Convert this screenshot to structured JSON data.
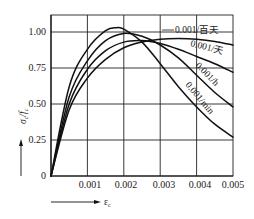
{
  "chart_data": {
    "type": "line",
    "title": "",
    "xlabel": "ε_c",
    "ylabel": "σ_c / f_c",
    "xlim": [
      0,
      0.005
    ],
    "ylim": [
      0,
      1.1
    ],
    "grid": true,
    "x_ticks": [
      "0.001",
      "0.002",
      "0.003",
      "0.004",
      "0.005"
    ],
    "y_ticks": [
      "0",
      "0.25",
      "0.50",
      "0.75",
      "1.00"
    ],
    "series": [
      {
        "name": "0.001/min",
        "x": [
          0,
          0.0005,
          0.001,
          0.0015,
          0.0018,
          0.002,
          0.0025,
          0.003,
          0.0035,
          0.004,
          0.0045,
          0.005
        ],
        "y": [
          0,
          0.62,
          0.88,
          1.01,
          1.03,
          1.02,
          0.93,
          0.78,
          0.62,
          0.48,
          0.36,
          0.27
        ]
      },
      {
        "name": "0.001/h",
        "x": [
          0,
          0.0005,
          0.001,
          0.0015,
          0.002,
          0.0025,
          0.003,
          0.0035,
          0.004,
          0.0045,
          0.005
        ],
        "y": [
          0,
          0.55,
          0.8,
          0.94,
          0.99,
          0.97,
          0.91,
          0.82,
          0.7,
          0.58,
          0.48
        ]
      },
      {
        "name": "0.001/天",
        "x": [
          0,
          0.0005,
          0.001,
          0.0015,
          0.002,
          0.0025,
          0.003,
          0.0035,
          0.004,
          0.0045,
          0.005
        ],
        "y": [
          0,
          0.5,
          0.74,
          0.87,
          0.93,
          0.94,
          0.92,
          0.88,
          0.83,
          0.78,
          0.72
        ]
      },
      {
        "name": "0.001/百天",
        "x": [
          0,
          0.0005,
          0.001,
          0.0015,
          0.002,
          0.0025,
          0.003,
          0.0035,
          0.004,
          0.0045,
          0.005
        ],
        "y": [
          0,
          0.46,
          0.68,
          0.81,
          0.89,
          0.93,
          0.95,
          0.955,
          0.95,
          0.935,
          0.91
        ]
      }
    ],
    "annotations": [
      {
        "text": "0.001/百天",
        "target_series": "0.001/百天"
      },
      {
        "text": "0.001/天",
        "target_series": "0.001/天"
      },
      {
        "text": "0.001/h",
        "target_series": "0.001/h"
      },
      {
        "text": "0.001/min",
        "target_series": "0.001/min"
      }
    ],
    "legend": "inline labels on curves (upper right)"
  },
  "labels": {
    "y_axis": "σ",
    "y_axis_sub": "c",
    "y_axis_div": "/",
    "y_axis_f": "f",
    "y_axis_f_sub": "c",
    "x_axis": "ε",
    "x_axis_sub": "c",
    "curve_1": "0.001/百天",
    "curve_2": "0.001/天",
    "curve_3": "0.001/h",
    "curve_4": "0.001/min",
    "x_tick_1": "0.001",
    "x_tick_2": "0.002",
    "x_tick_3": "0.003",
    "x_tick_4": "0.004",
    "x_tick_5": "0.005",
    "y_tick_0": "0",
    "y_tick_1": "0.25",
    "y_tick_2": "0.50",
    "y_tick_3": "0.75",
    "y_tick_4": "1.00"
  }
}
